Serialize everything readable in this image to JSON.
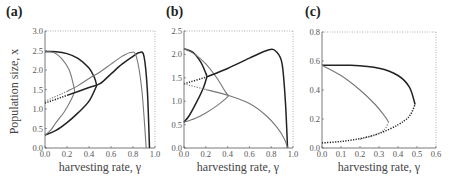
{
  "figure": {
    "y_axis_label": "Population size, x",
    "panels": [
      {
        "id": "a",
        "label": "(a)",
        "xlabel": "harvesting rate, γ",
        "xticks": [
          "0.0",
          "0.2",
          "0.4",
          "0.6",
          "0.8",
          "1.0"
        ],
        "yticks": [
          "0.0",
          "0.5",
          "1.0",
          "1.5",
          "2.0",
          "2.5",
          "3.0"
        ]
      },
      {
        "id": "b",
        "label": "(b)",
        "xlabel": "harvesting rate, γ",
        "xticks": [
          "0.0",
          "0.2",
          "0.4",
          "0.6",
          "0.8",
          "1.0"
        ],
        "yticks": [
          "0.0",
          "0.5",
          "1.0",
          "1.5",
          "2.0",
          "2.5"
        ]
      },
      {
        "id": "c",
        "label": "(c)",
        "xlabel": "harvesting rate, γ",
        "xticks": [
          "0.0",
          "0.1",
          "0.2",
          "0.3",
          "0.4",
          "0.5",
          "0.6"
        ],
        "yticks": [
          "0.0",
          "0.2",
          "0.4",
          "0.6",
          "0.8"
        ]
      }
    ]
  },
  "chart_data": [
    {
      "type": "line",
      "title": "(a)",
      "xlabel": "harvesting rate, γ",
      "ylabel": "Population size, x",
      "xlim": [
        0,
        1.0
      ],
      "ylim": [
        0,
        3.0
      ],
      "grid": false,
      "series": [
        {
          "name": "dark C-fold (stable branch)",
          "style": "solid-dark",
          "points": [
            [
              0,
              2.47
            ],
            [
              0.1,
              2.47
            ],
            [
              0.2,
              2.42
            ],
            [
              0.3,
              2.3
            ],
            [
              0.4,
              2.05
            ],
            [
              0.45,
              1.8
            ],
            [
              0.47,
              1.6
            ]
          ]
        },
        {
          "name": "dark C-fold (lower branch)",
          "style": "solid-dark",
          "points": [
            [
              0,
              0.33
            ],
            [
              0.1,
              0.45
            ],
            [
              0.2,
              0.65
            ],
            [
              0.3,
              0.9
            ],
            [
              0.4,
              1.2
            ],
            [
              0.47,
              1.6
            ]
          ]
        },
        {
          "name": "gray C-fold (upper branch)",
          "style": "solid-gray",
          "points": [
            [
              0,
              2.47
            ],
            [
              0.08,
              2.45
            ],
            [
              0.15,
              2.3
            ],
            [
              0.22,
              2.0
            ],
            [
              0.26,
              1.6
            ],
            [
              0.27,
              1.45
            ]
          ]
        },
        {
          "name": "gray C-fold (lower branch)",
          "style": "solid-gray",
          "points": [
            [
              0,
              0.33
            ],
            [
              0.05,
              0.45
            ],
            [
              0.1,
              0.65
            ],
            [
              0.18,
              0.95
            ],
            [
              0.24,
              1.25
            ],
            [
              0.27,
              1.45
            ]
          ]
        },
        {
          "name": "dark interior branch",
          "style": "dotted-then-solid-dark",
          "points": [
            [
              0,
              1.15
            ],
            [
              0.2,
              1.35
            ],
            [
              0.4,
              1.55
            ],
            [
              0.5,
              1.65
            ],
            [
              0.6,
              1.9
            ],
            [
              0.7,
              2.15
            ],
            [
              0.8,
              2.35
            ],
            [
              0.86,
              2.45
            ],
            [
              0.9,
              2.35
            ],
            [
              0.93,
              1.5
            ],
            [
              0.95,
              0.0
            ]
          ]
        },
        {
          "name": "gray interior branch",
          "style": "dotted-then-solid-gray",
          "points": [
            [
              0,
              1.2
            ],
            [
              0.2,
              1.45
            ],
            [
              0.3,
              1.6
            ],
            [
              0.4,
              1.78
            ],
            [
              0.5,
              1.95
            ],
            [
              0.6,
              2.15
            ],
            [
              0.7,
              2.35
            ],
            [
              0.78,
              2.45
            ],
            [
              0.83,
              2.35
            ],
            [
              0.88,
              1.5
            ],
            [
              0.92,
              0.0
            ]
          ]
        }
      ]
    },
    {
      "type": "line",
      "title": "(b)",
      "xlabel": "harvesting rate, γ",
      "xlim": [
        0,
        1.0
      ],
      "ylim": [
        0,
        2.5
      ],
      "grid": false,
      "series": [
        {
          "name": "dark C-fold upper",
          "style": "solid-dark",
          "points": [
            [
              0,
              2.12
            ],
            [
              0.08,
              2.05
            ],
            [
              0.15,
              1.85
            ],
            [
              0.2,
              1.6
            ],
            [
              0.21,
              1.52
            ]
          ]
        },
        {
          "name": "dark C-fold lower",
          "style": "solid-dark",
          "points": [
            [
              0,
              0.55
            ],
            [
              0.05,
              0.7
            ],
            [
              0.12,
              1.0
            ],
            [
              0.18,
              1.3
            ],
            [
              0.21,
              1.52
            ]
          ]
        },
        {
          "name": "gray C-fold upper",
          "style": "solid-gray",
          "points": [
            [
              0,
              2.12
            ],
            [
              0.1,
              2.0
            ],
            [
              0.2,
              1.8
            ],
            [
              0.3,
              1.5
            ],
            [
              0.38,
              1.2
            ],
            [
              0.41,
              1.12
            ]
          ]
        },
        {
          "name": "gray C-fold lower",
          "style": "solid-gray",
          "points": [
            [
              0,
              0.55
            ],
            [
              0.1,
              0.63
            ],
            [
              0.2,
              0.75
            ],
            [
              0.3,
              0.9
            ],
            [
              0.38,
              1.05
            ],
            [
              0.41,
              1.12
            ]
          ]
        },
        {
          "name": "dark rising branch",
          "style": "dotted-then-solid-dark",
          "points": [
            [
              0,
              1.37
            ],
            [
              0.21,
              1.52
            ],
            [
              0.4,
              1.7
            ],
            [
              0.6,
              1.92
            ],
            [
              0.78,
              2.1
            ],
            [
              0.85,
              2.05
            ],
            [
              0.9,
              1.8
            ],
            [
              0.93,
              1.0
            ],
            [
              0.95,
              0.0
            ]
          ]
        },
        {
          "name": "gray falling branch",
          "style": "dotted-then-solid-gray",
          "points": [
            [
              0,
              1.37
            ],
            [
              0.2,
              1.25
            ],
            [
              0.41,
              1.12
            ],
            [
              0.6,
              0.95
            ],
            [
              0.75,
              0.7
            ],
            [
              0.85,
              0.45
            ],
            [
              0.92,
              0.2
            ],
            [
              0.95,
              0.0
            ]
          ]
        }
      ]
    },
    {
      "type": "line",
      "title": "(c)",
      "xlabel": "harvesting rate, γ",
      "xlim": [
        0,
        0.6
      ],
      "ylim": [
        0,
        0.8
      ],
      "grid": false,
      "series": [
        {
          "name": "dark fold upper",
          "style": "solid-dark",
          "points": [
            [
              0,
              0.57
            ],
            [
              0.15,
              0.57
            ],
            [
              0.3,
              0.55
            ],
            [
              0.4,
              0.5
            ],
            [
              0.46,
              0.42
            ],
            [
              0.49,
              0.3
            ]
          ]
        },
        {
          "name": "dark fold lower",
          "style": "dotted-dark",
          "points": [
            [
              0,
              0.035
            ],
            [
              0.1,
              0.045
            ],
            [
              0.2,
              0.065
            ],
            [
              0.3,
              0.1
            ],
            [
              0.4,
              0.16
            ],
            [
              0.46,
              0.22
            ],
            [
              0.49,
              0.3
            ]
          ]
        },
        {
          "name": "gray fold upper",
          "style": "solid-gray",
          "points": [
            [
              0,
              0.57
            ],
            [
              0.1,
              0.5
            ],
            [
              0.2,
              0.4
            ],
            [
              0.28,
              0.3
            ],
            [
              0.33,
              0.22
            ],
            [
              0.35,
              0.18
            ]
          ]
        },
        {
          "name": "gray fold lower",
          "style": "dotted-gray",
          "points": [
            [
              0.2,
              0.06
            ],
            [
              0.28,
              0.09
            ],
            [
              0.33,
              0.13
            ],
            [
              0.35,
              0.18
            ]
          ]
        }
      ]
    }
  ]
}
